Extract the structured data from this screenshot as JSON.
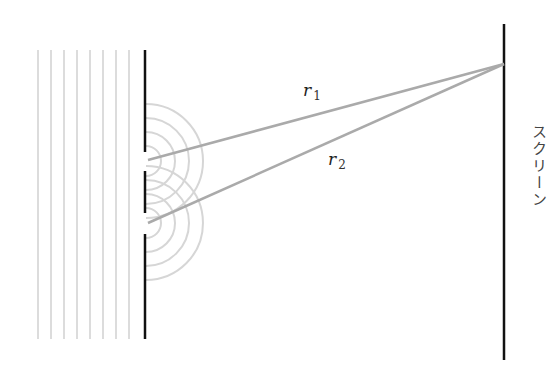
{
  "diagram": {
    "labels": {
      "r1": {
        "main": "r",
        "sub": "1"
      },
      "r2": {
        "main": "r",
        "sub": "2"
      },
      "screen": "スクリーン"
    },
    "incident_wavefront_count": 8,
    "slit_count": 2,
    "wavefront_arcs_per_slit": 4,
    "colors": {
      "barrier": "#111111",
      "screen": "#111111",
      "rays": "#aaaaaa",
      "wavefronts": "#d6d6d6"
    }
  }
}
